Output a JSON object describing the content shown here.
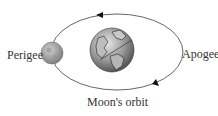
{
  "diagram": {
    "labels": {
      "perigee": "Perigee",
      "apogee": "Apogee",
      "orbit": "Moon's orbit"
    },
    "nodes": [
      {
        "id": "earth",
        "type": "planet",
        "label": ""
      },
      {
        "id": "moon",
        "type": "satellite",
        "label": "",
        "position": "perigee"
      }
    ],
    "edges": [
      {
        "from": "moon",
        "to": "earth",
        "type": "orbit",
        "direction": "counterclockwise",
        "label": "Moon's orbit"
      }
    ],
    "colors": {
      "orbit_line": "#555555",
      "earth": "#8a8a8a",
      "moon": "#a0a0a0",
      "text": "#333333"
    }
  }
}
